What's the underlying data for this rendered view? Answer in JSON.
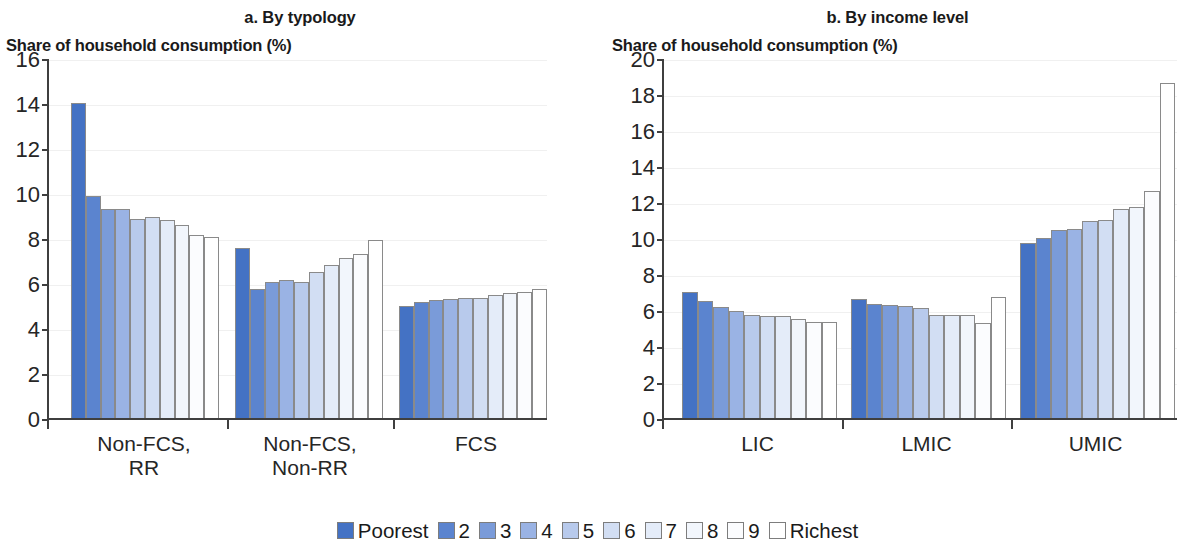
{
  "chart_data": [
    {
      "type": "bar",
      "panel_id": "a",
      "title": "a. By typology",
      "ylabel": "Share of household consumption (%)",
      "xlabel": "",
      "ylim": [
        0,
        16
      ],
      "yticks": [
        0,
        2,
        4,
        6,
        8,
        10,
        12,
        14,
        16
      ],
      "grid": true,
      "legend_position": "bottom",
      "categories": [
        "Non-FCS,\nRR",
        "Non-FCS,\nNon-RR",
        "FCS"
      ],
      "series": [
        {
          "name": "Poorest",
          "values": [
            14.0,
            7.55,
            5.0
          ]
        },
        {
          "name": "2",
          "values": [
            9.85,
            5.75,
            5.15
          ]
        },
        {
          "name": "3",
          "values": [
            9.3,
            6.05,
            5.25
          ]
        },
        {
          "name": "4",
          "values": [
            9.3,
            6.15,
            5.3
          ]
        },
        {
          "name": "5",
          "values": [
            8.85,
            6.05,
            5.35
          ]
        },
        {
          "name": "6",
          "values": [
            8.95,
            6.5,
            5.35
          ]
        },
        {
          "name": "7",
          "values": [
            8.8,
            6.8,
            5.45
          ]
        },
        {
          "name": "8",
          "values": [
            8.6,
            7.1,
            5.55
          ]
        },
        {
          "name": "9",
          "values": [
            8.15,
            7.3,
            5.6
          ]
        },
        {
          "name": "Richest",
          "values": [
            8.05,
            7.9,
            5.75
          ]
        }
      ]
    },
    {
      "type": "bar",
      "panel_id": "b",
      "title": "b. By income level",
      "ylabel": "Share of household consumption (%)",
      "xlabel": "",
      "ylim": [
        0,
        20
      ],
      "yticks": [
        0,
        2,
        4,
        6,
        8,
        10,
        12,
        14,
        16,
        18,
        20
      ],
      "grid": true,
      "legend_position": "bottom",
      "categories": [
        "LIC",
        "LMIC",
        "UMIC"
      ],
      "series": [
        {
          "name": "Poorest",
          "values": [
            7.0,
            6.6,
            9.7
          ]
        },
        {
          "name": "2",
          "values": [
            6.5,
            6.35,
            10.0
          ]
        },
        {
          "name": "3",
          "values": [
            6.15,
            6.3,
            10.45
          ]
        },
        {
          "name": "4",
          "values": [
            5.95,
            6.2,
            10.5
          ]
        },
        {
          "name": "5",
          "values": [
            5.75,
            6.1,
            10.95
          ]
        },
        {
          "name": "6",
          "values": [
            5.65,
            5.7,
            11.0
          ]
        },
        {
          "name": "7",
          "values": [
            5.65,
            5.7,
            11.6
          ]
        },
        {
          "name": "8",
          "values": [
            5.5,
            5.7,
            11.7
          ]
        },
        {
          "name": "9",
          "values": [
            5.35,
            5.3,
            12.6
          ]
        },
        {
          "name": "Richest",
          "values": [
            5.35,
            6.7,
            18.6
          ]
        }
      ]
    }
  ],
  "legend": {
    "items": [
      {
        "label": "Poorest",
        "color": "#4472c4"
      },
      {
        "label": "2",
        "color": "#5b84cf"
      },
      {
        "label": "3",
        "color": "#7a9bd9"
      },
      {
        "label": "4",
        "color": "#9ab3e4"
      },
      {
        "label": "5",
        "color": "#b8caec"
      },
      {
        "label": "6",
        "color": "#d2def3"
      },
      {
        "label": "7",
        "color": "#e4ecf9"
      },
      {
        "label": "8",
        "color": "#f2f6fc"
      },
      {
        "label": "9",
        "color": "#fbfcfe"
      },
      {
        "label": "Richest",
        "color": "#ffffff"
      }
    ]
  },
  "style": {
    "axis_color": "#3f3f3f",
    "grid_color": "#f0f0f0",
    "bar_outline": "#8a8a8a",
    "text_color": "#1a1a1a"
  }
}
